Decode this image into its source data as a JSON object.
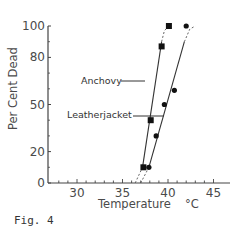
{
  "figure": {
    "caption": "Fig. 4"
  },
  "chart_data": {
    "type": "line",
    "title": "",
    "xlabel": "Temperature",
    "xunit": "°C",
    "ylabel": "Per Cent Dead",
    "xlim": [
      27,
      46
    ],
    "ylim": [
      0,
      100
    ],
    "x_ticks": [
      30,
      35,
      40,
      45
    ],
    "x_minor_step": 1,
    "y_ticks": [
      0,
      20,
      50,
      80,
      100
    ],
    "y_minor_ticks": [
      10,
      30,
      40,
      60,
      70,
      90
    ],
    "grid": false,
    "legend": "inline labels with leader lines",
    "series": [
      {
        "name": "Anchovy",
        "marker": "square",
        "points": [
          {
            "x": 37.3,
            "y": 10
          },
          {
            "x": 38.1,
            "y": 40
          },
          {
            "x": 39.3,
            "y": 87
          },
          {
            "x": 40.1,
            "y": 100
          }
        ],
        "fit_line": [
          {
            "x": 37.2,
            "y": 10
          },
          {
            "x": 39.3,
            "y": 90
          }
        ],
        "dashed_extensions": [
          [
            {
              "x": 36.4,
              "y": 0
            },
            {
              "x": 37.2,
              "y": 10
            }
          ],
          [
            {
              "x": 39.3,
              "y": 90
            },
            {
              "x": 39.6,
              "y": 97
            },
            {
              "x": 40.1,
              "y": 100
            }
          ]
        ]
      },
      {
        "name": "Leatherjacket",
        "marker": "circle",
        "points": [
          {
            "x": 37.9,
            "y": 10
          },
          {
            "x": 38.7,
            "y": 30
          },
          {
            "x": 39.6,
            "y": 50
          },
          {
            "x": 40.7,
            "y": 59
          },
          {
            "x": 42.0,
            "y": 100
          }
        ],
        "fit_line": [
          {
            "x": 37.9,
            "y": 10
          },
          {
            "x": 41.8,
            "y": 90
          }
        ],
        "dashed_extensions": [
          [
            {
              "x": 37.0,
              "y": 0
            },
            {
              "x": 37.9,
              "y": 10
            }
          ],
          [
            {
              "x": 41.8,
              "y": 90
            },
            {
              "x": 42.4,
              "y": 98
            },
            {
              "x": 43.0,
              "y": 100
            }
          ]
        ]
      }
    ],
    "annotations": [
      {
        "text": "Anchovy",
        "points_to": "Anchovy",
        "at": {
          "x": 37.7,
          "y": 59
        }
      },
      {
        "text": "Leatherjacket",
        "points_to": "Leatherjacket",
        "at": {
          "x": 38.1,
          "y": 40
        }
      }
    ]
  },
  "labels": {
    "x_title": "Temperature",
    "x_unit": "°C",
    "y_title": "Per Cent Dead",
    "anchovy": "Anchovy",
    "leatherjacket": "Leatherjacket"
  }
}
